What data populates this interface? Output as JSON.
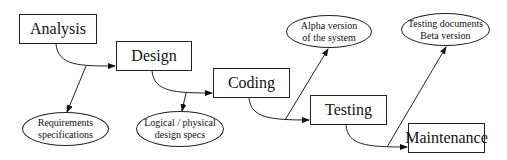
{
  "diagram": {
    "type": "waterfall-model",
    "phases": [
      {
        "label": "Analysis"
      },
      {
        "label": "Design"
      },
      {
        "label": "Coding"
      },
      {
        "label": "Testing"
      },
      {
        "label": "Maintenance"
      }
    ],
    "outputs": [
      {
        "line1": "Requirements",
        "line2": "specifications"
      },
      {
        "line1": "Logical / physical",
        "line2": "design specs"
      },
      {
        "line1": "Alpha version",
        "line2": "of the system"
      },
      {
        "line1": "Testing documents",
        "line2": "Beta version"
      }
    ]
  }
}
